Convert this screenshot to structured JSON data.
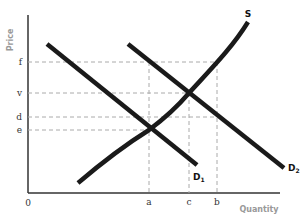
{
  "diagram": {
    "type": "supply-demand",
    "axes": {
      "y_title": "Price",
      "x_title": "Quantity",
      "origin_label": "0"
    },
    "price_levels": [
      {
        "label": "f",
        "y": 62
      },
      {
        "label": "v",
        "y": 93
      },
      {
        "label": "d",
        "y": 117
      },
      {
        "label": "e",
        "y": 130
      }
    ],
    "quantity_levels": [
      {
        "label": "a",
        "x": 149
      },
      {
        "label": "c",
        "x": 189
      },
      {
        "label": "b",
        "x": 217
      }
    ],
    "curves": {
      "supply": {
        "label": "S"
      },
      "demand1": {
        "label": "D",
        "sub": "1"
      },
      "demand2": {
        "label": "D",
        "sub": "2"
      }
    },
    "colors": {
      "curve": "#1a1a1a",
      "axis": "#333333",
      "guide": "#aaaaaa",
      "axis_title": "#999999"
    }
  }
}
